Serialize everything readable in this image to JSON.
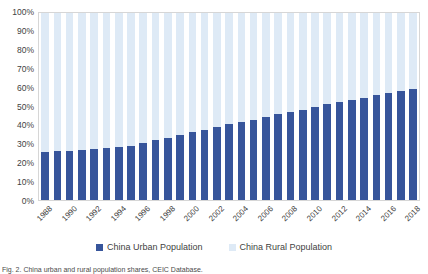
{
  "chart_data": {
    "type": "bar",
    "stacked": true,
    "title": "",
    "xlabel": "",
    "ylabel": "",
    "ylim": [
      0,
      100
    ],
    "ytick_labels": [
      "100%",
      "90%",
      "80%",
      "70%",
      "60%",
      "50%",
      "40%",
      "30%",
      "20%",
      "10%",
      "0%"
    ],
    "ytick_values": [
      100,
      90,
      80,
      70,
      60,
      50,
      40,
      30,
      20,
      10,
      0
    ],
    "grid": false,
    "legend_position": "bottom",
    "categories": [
      "1988",
      "1989",
      "1990",
      "1991",
      "1992",
      "1993",
      "1994",
      "1995",
      "1996",
      "1997",
      "1998",
      "1999",
      "2000",
      "2001",
      "2002",
      "2003",
      "2004",
      "2005",
      "2006",
      "2007",
      "2008",
      "2009",
      "2010",
      "2011",
      "2012",
      "2013",
      "2014",
      "2015",
      "2016",
      "2017",
      "2018"
    ],
    "xtick_labels_shown": [
      "1988",
      "1990",
      "1992",
      "1994",
      "1996",
      "1998",
      "2000",
      "2002",
      "2004",
      "2006",
      "2008",
      "2010",
      "2012",
      "2014",
      "2016",
      "2018"
    ],
    "series": [
      {
        "name": "China Urban Population",
        "color": "#37559b",
        "values": [
          25.8,
          26.2,
          26.4,
          26.9,
          27.5,
          28.0,
          28.5,
          29.0,
          30.5,
          31.9,
          33.4,
          34.8,
          36.2,
          37.7,
          39.1,
          40.5,
          41.8,
          43.0,
          44.3,
          45.9,
          47.0,
          48.3,
          49.9,
          51.3,
          52.6,
          53.7,
          54.8,
          56.1,
          57.4,
          58.5,
          59.6
        ]
      },
      {
        "name": "China Rural Population",
        "color": "#deeaf6",
        "values": [
          74.2,
          73.8,
          73.6,
          73.1,
          72.5,
          72.0,
          71.5,
          71.0,
          69.5,
          68.1,
          66.6,
          65.2,
          63.8,
          62.3,
          60.9,
          59.5,
          58.2,
          57.0,
          55.7,
          54.1,
          53.0,
          51.7,
          50.1,
          48.7,
          47.4,
          46.3,
          45.2,
          43.9,
          42.6,
          41.5,
          40.4
        ]
      }
    ]
  },
  "legend": {
    "items": [
      {
        "label": "China Urban Population",
        "color": "#37559b"
      },
      {
        "label": "China Rural Population",
        "color": "#deeaf6"
      }
    ]
  },
  "caption": {
    "text": "Fig. 2. China urban and rural population shares, CEIC Database."
  }
}
